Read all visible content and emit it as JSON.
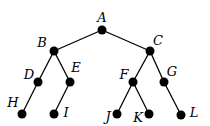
{
  "diagram": {
    "type": "binary-tree",
    "nodes": [
      {
        "id": "A",
        "label": "A"
      },
      {
        "id": "B",
        "label": "B"
      },
      {
        "id": "C",
        "label": "C"
      },
      {
        "id": "D",
        "label": "D"
      },
      {
        "id": "E",
        "label": "E"
      },
      {
        "id": "F",
        "label": "F"
      },
      {
        "id": "G",
        "label": "G"
      },
      {
        "id": "H",
        "label": "H"
      },
      {
        "id": "I",
        "label": "I"
      },
      {
        "id": "J",
        "label": "J"
      },
      {
        "id": "K",
        "label": "K"
      },
      {
        "id": "L",
        "label": "L"
      }
    ],
    "edges": [
      [
        "A",
        "B"
      ],
      [
        "A",
        "C"
      ],
      [
        "B",
        "D"
      ],
      [
        "B",
        "E"
      ],
      [
        "C",
        "F"
      ],
      [
        "C",
        "G"
      ],
      [
        "D",
        "H"
      ],
      [
        "E",
        "I"
      ],
      [
        "F",
        "J"
      ],
      [
        "F",
        "K"
      ],
      [
        "G",
        "L"
      ]
    ],
    "colors": {
      "node": "#000000",
      "edge": "#000000",
      "label": "#000000"
    }
  }
}
